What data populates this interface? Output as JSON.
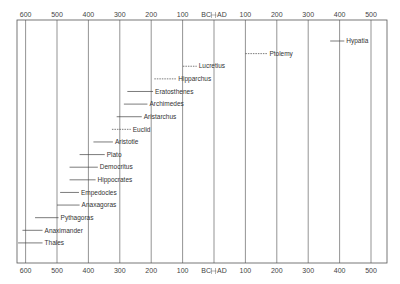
{
  "chart_data": {
    "type": "timeline",
    "title": "",
    "xlabel": "",
    "ylabel": "",
    "axis": {
      "top_ticks": [
        "600",
        "500",
        "400",
        "300",
        "200",
        "100",
        "BC",
        "AD",
        "100",
        "200",
        "300",
        "400",
        "500"
      ],
      "bottom_ticks": [
        "600",
        "500",
        "400",
        "300",
        "200",
        "100",
        "BC",
        "AD",
        "100",
        "200",
        "300",
        "400",
        "500"
      ],
      "era_divider_label_left": "BC",
      "era_divider_label_right": "AD",
      "range": [
        -650,
        530
      ],
      "gridlines": [
        -600,
        -500,
        -400,
        -300,
        -200,
        -100,
        0,
        100,
        200,
        300,
        400,
        500
      ],
      "grid": true
    },
    "series": [
      {
        "name": "Hypatia",
        "start": 370,
        "end": 415,
        "style": "solid"
      },
      {
        "name": "Ptolemy",
        "start": 100,
        "end": 170,
        "style": "dashed"
      },
      {
        "name": "Lucretius",
        "start": -99,
        "end": -55,
        "style": "dashed"
      },
      {
        "name": "Hipparchus",
        "start": -190,
        "end": -120,
        "style": "dashed"
      },
      {
        "name": "Eratosthenes",
        "start": -276,
        "end": -194,
        "style": "solid"
      },
      {
        "name": "Archimedes",
        "start": -287,
        "end": -212,
        "style": "solid"
      },
      {
        "name": "Aristarchus",
        "start": -310,
        "end": -230,
        "style": "solid"
      },
      {
        "name": "Euclid",
        "start": -325,
        "end": -265,
        "style": "dashed"
      },
      {
        "name": "Aristotle",
        "start": -384,
        "end": -322,
        "style": "solid"
      },
      {
        "name": "Plato",
        "start": -428,
        "end": -348,
        "style": "solid"
      },
      {
        "name": "Democritus",
        "start": -460,
        "end": -370,
        "style": "solid"
      },
      {
        "name": "Hippocrates",
        "start": -460,
        "end": -377,
        "style": "solid"
      },
      {
        "name": "Empedocles",
        "start": -490,
        "end": -430,
        "style": "solid"
      },
      {
        "name": "Anaxagoras",
        "start": -500,
        "end": -428,
        "style": "solid"
      },
      {
        "name": "Pythagoras",
        "start": -570,
        "end": -495,
        "style": "solid"
      },
      {
        "name": "Anaximander",
        "start": -610,
        "end": -546,
        "style": "solid"
      },
      {
        "name": "Thales",
        "start": -624,
        "end": -546,
        "style": "solid"
      }
    ]
  },
  "colors": {
    "frame": "#555555",
    "grid": "#666666",
    "bar": "#444444",
    "text": "#333333"
  }
}
